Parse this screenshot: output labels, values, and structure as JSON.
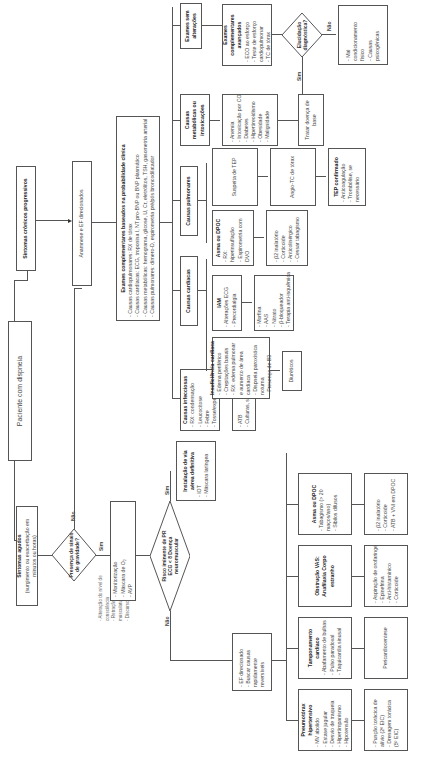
{
  "diagram": {
    "start": "Paciente com dispneia",
    "chronic": "Sintomas crônicos progressivos",
    "acute": {
      "title": "Sintomas agudos",
      "subtitle": "(surgimento ou exacerbação em minutos ou horas)"
    },
    "severity_decision": {
      "question": "Presença de sinais de gravidade?",
      "yes": "Sim",
      "no": "Não"
    },
    "severity_signs": [
      "- Alteração do nível de consciência",
      "- Retração e uso de musculatura acessória",
      "- Discurso fragmentado"
    ],
    "anamnesis": "Anamnese e EF direcionados",
    "complementary_exams": {
      "title": "Exames complementares baseados na probabilidade clínica",
      "items": [
        "- Causas cardiopulmonares: RX de tórax",
        "- Causas cardíacas: ECG, troponina I, NT pro-BNP ou BNP plasmático",
        "- Causas metabólicas: hemograma, glicose, U, Cr, eletrólitos, TSH, gasometria arterial",
        "- Causas pulmonares: dímero-D, espirometria pré/pós broncodilatador"
      ]
    },
    "branches": {
      "infectious": {
        "title": "Causas infecciosas",
        "items": [
          "- RX: condensação",
          "- Leucocitose",
          "- Febre",
          "- Tosse/expectoração"
        ],
        "treatment": [
          "- ATB",
          "- Culturas, se necessário"
        ]
      },
      "cardiac": {
        "title": "Causas cardíacas",
        "heart_failure": {
          "title": "Insuficiência cardíaca",
          "items": [
            "- Edema periférico",
            "- Crepitações basais",
            "- RX: edema pulmonar e aumento de área cardíaca",
            "- Dispneia paroxística noturna",
            "- Presença de B3"
          ],
          "treatment": "Diuréticos"
        },
        "iam": {
          "title": "IAM",
          "items": [
            "- Alterações ECG",
            "- Precordialgia"
          ],
          "treatment": [
            "- Morfina",
            "- AAS",
            "- Nitrato",
            "- β-bloqueador",
            "- Terapia anti-isquêmica"
          ]
        }
      },
      "pulmonary": {
        "title": "Causas pulmonares",
        "asthma": {
          "title": "Asma ou DPOC",
          "items": [
            "- RX: hiperinsuflação",
            "- Espirometria com DVO"
          ],
          "treatment": [
            "- β2 inalatório",
            "- Corticoide",
            "- Anticolinérgico",
            "- Cessar tabagismo"
          ]
        },
        "tep": {
          "suspicion": "Suspeita de TEP",
          "exam": "Angio-TC de tórax",
          "confirmed": {
            "title": "TEP confirmado",
            "items": [
              "- Anticoagulação",
              "- Trombólise, se necessário"
            ]
          }
        }
      },
      "metabolic": {
        "title": "Causas metabólicas ou intoxicações",
        "items": [
          "- Anemia",
          "- Intoxicação por CO",
          "- Diabetes",
          "- Hipertireoidismo",
          "- Obesidade",
          "- Malignidade"
        ],
        "treatment": "Tratar doença de base"
      },
      "normal_exams": {
        "title": "Exames sem alterações",
        "advanced": {
          "title": "Exames complementares avançados",
          "items": [
            "- ECO ao esforço",
            "- Teste de esforço cardiopulmonar",
            "- TC de tórax"
          ]
        },
        "decision": {
          "question": "Elucidação diagnóstica?",
          "yes": "Sim",
          "no": "Não"
        },
        "no_result": [
          "- Mal condicionamento físico",
          "- Causas psicogênicas"
        ]
      }
    },
    "acute_path": {
      "monitoring": [
        "- Monitorização",
        "- Máscara de O₂",
        "- AVP"
      ],
      "decision": {
        "question": "Risco iminente de PR ECG < 8 Doença neuromuscular",
        "yes": "Sim",
        "no": "Não"
      },
      "airway": {
        "title": "Instalação de via aérea definitiva",
        "items": [
          "- IOT",
          "- Máscara laríngea"
        ]
      },
      "directed": [
        "- EF direcionado",
        "- Buscar causas rapidamente reversíveis"
      ],
      "causes": {
        "pneumothorax": {
          "title": "Pneumotórax hipertensivo",
          "items": [
            "- MV abolido",
            "- Estase jugular",
            "- Desvio de traqueia",
            "- Hipertimpanismo",
            "- Hipotensão"
          ],
          "treatment": [
            "- Punção torácica de alívio (2º EIC)",
            "- Drenagem torácica (5º EIC)"
          ]
        },
        "tamponade": {
          "title": "Tamponamento cardíaco",
          "items": [
            "- Abafamento de bulhas",
            "- Pulso paradoxal",
            "- Taquicardia sinusal"
          ],
          "treatment": "Pericardiocentese"
        },
        "obstruction": {
          "title": "Obstrução VAS: Anafilaxia Corpo estranho",
          "treatment": [
            "- Aspiração de orofaringe",
            "- Epinefrina",
            "- Anti-histamínico",
            "- Corticoide"
          ]
        },
        "asthma": {
          "title": "Asma ou DPOC",
          "items": [
            "- Tabagismo (> 20 maços/ano)",
            "- Sibilos difusos"
          ],
          "treatment": [
            "- β2 inalatório",
            "- Corticoide",
            "- ATB + VNI em DPOC"
          ]
        }
      }
    }
  }
}
